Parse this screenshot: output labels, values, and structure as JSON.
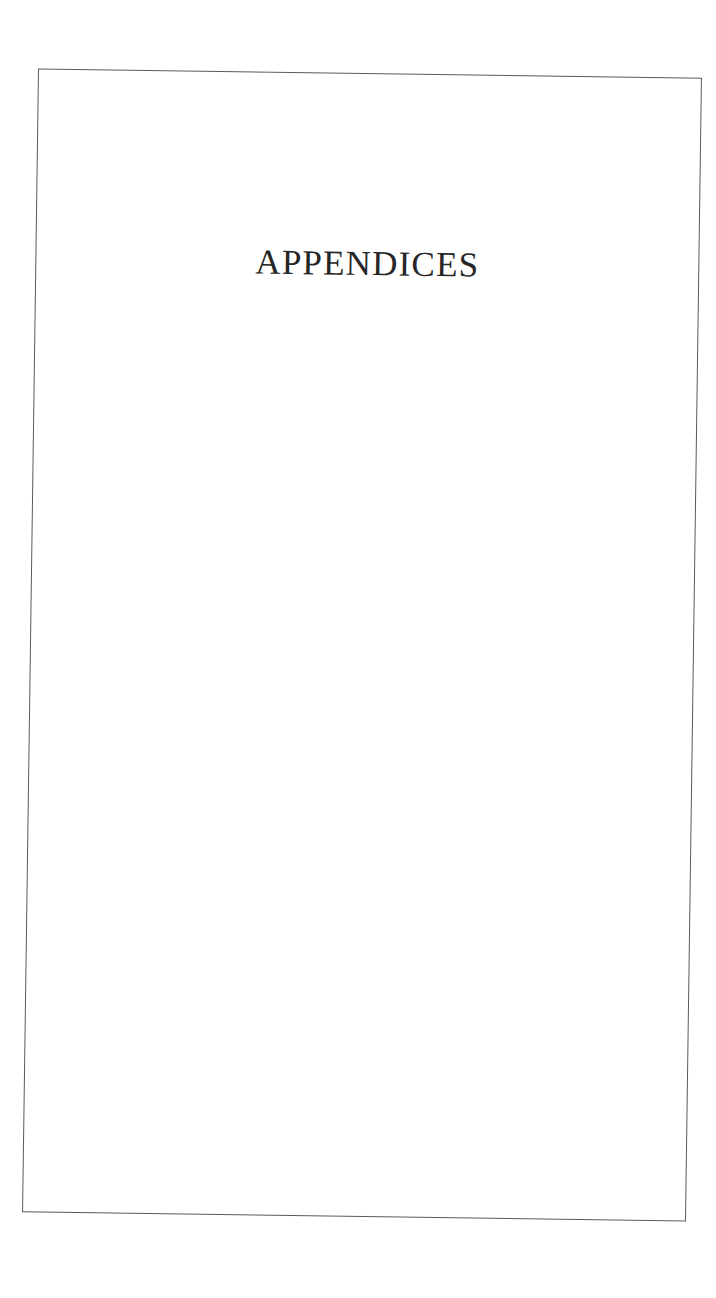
{
  "page": {
    "title": "APPENDICES",
    "frame_color": "#5a5a5a",
    "text_color": "#262626"
  }
}
